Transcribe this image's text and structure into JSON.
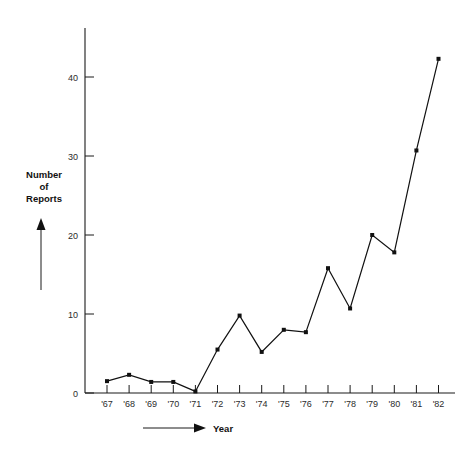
{
  "chart_data": {
    "type": "line",
    "title": "",
    "xlabel": "Year",
    "ylabel": "Number of Reports",
    "categories": [
      "'67",
      "'68",
      "'69",
      "'70",
      "'71",
      "'72",
      "'73",
      "'74",
      "'75",
      "'76",
      "'77",
      "'78",
      "'79",
      "'80",
      "'81",
      "'82"
    ],
    "values": [
      1.5,
      2.3,
      1.4,
      1.4,
      0.2,
      5.5,
      9.8,
      5.2,
      8.0,
      7.7,
      15.8,
      10.7,
      20.0,
      17.8,
      30.7,
      42.3
    ],
    "series": [
      {
        "name": "Number of Reports",
        "values": [
          1.5,
          2.3,
          1.4,
          1.4,
          0.2,
          5.5,
          9.8,
          5.2,
          8.0,
          7.7,
          15.8,
          10.7,
          20.0,
          17.8,
          30.7,
          42.3
        ]
      }
    ],
    "ylim": [
      0,
      45
    ],
    "yticks": [
      0,
      10,
      20,
      30,
      40
    ],
    "ytick_labels": [
      "0",
      "10",
      "20",
      "30",
      "40"
    ],
    "xtick_labels": [
      "'67",
      "'68",
      "'69",
      "'70",
      "'71",
      "'72",
      "'73",
      "'74",
      "'75",
      "'76",
      "'77",
      "'78",
      "'79",
      "'80",
      "'81",
      "'82"
    ],
    "grid": false,
    "legend": false,
    "legend_position": "none",
    "marker": "filled-square",
    "line_color": "#111111",
    "marker_color": "#111111",
    "axis_color": "#1a1a1a",
    "background_color": "#ffffff"
  },
  "labels": {
    "y_axis_title_line1": "Number",
    "y_axis_title_line2": "of",
    "y_axis_title_line3": "Reports",
    "x_axis_title": "Year"
  },
  "icons": {
    "y_arrow": "arrow-up-icon",
    "x_arrow": "arrow-right-icon"
  }
}
